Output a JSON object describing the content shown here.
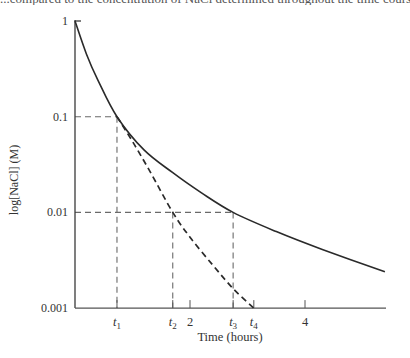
{
  "page": {
    "top_cut_text": "...compared to the concentration of NaCl determined throughout the time course of the dialysis, showing the logarithm of concentration..."
  },
  "chart_data": {
    "type": "line",
    "title": "",
    "xlabel": "Time (hours)",
    "ylabel": "log[NaCl] (M)",
    "yscale": "log",
    "ylim": [
      0.001,
      1
    ],
    "xlim": [
      0,
      5.4
    ],
    "grid": false,
    "legend": null,
    "y_ticks": [
      {
        "value": 1,
        "label": "1"
      },
      {
        "value": 0.1,
        "label": "0.1"
      },
      {
        "value": 0.01,
        "label": "0.01"
      },
      {
        "value": 0.001,
        "label": "0.001"
      }
    ],
    "x_ticks": [
      {
        "value": 0.73,
        "label": "t1",
        "sub": "1",
        "kind": "marker"
      },
      {
        "value": 1.7,
        "label": "t2",
        "sub": "2",
        "kind": "marker"
      },
      {
        "value": 2.0,
        "label": "2",
        "kind": "numeric"
      },
      {
        "value": 2.75,
        "label": "t3",
        "sub": "3",
        "kind": "marker"
      },
      {
        "value": 3.11,
        "label": "t4",
        "sub": "4",
        "kind": "marker"
      },
      {
        "value": 4.0,
        "label": "4",
        "kind": "numeric"
      }
    ],
    "series": [
      {
        "name": "single continuous dialysis",
        "style": "solid",
        "x": [
          0,
          0.2,
          0.4,
          0.73,
          1.2,
          1.7,
          2.2,
          2.75,
          3.5,
          4.3,
          5.39
        ],
        "y": [
          1,
          0.45,
          0.24,
          0.1,
          0.045,
          0.026,
          0.016,
          0.01,
          0.0063,
          0.0041,
          0.0024
        ]
      },
      {
        "name": "dialysis with buffer changes",
        "style": "dashed",
        "x": [
          0.73,
          1.0,
          1.3,
          1.7,
          2.0,
          2.4,
          2.75,
          3.11
        ],
        "y": [
          0.1,
          0.055,
          0.027,
          0.01,
          0.0055,
          0.0028,
          0.0016,
          0.001
        ]
      }
    ],
    "annotations": [
      {
        "type": "dashed-guide",
        "from": [
          0,
          0.1
        ],
        "to": [
          0.73,
          0.1
        ],
        "then_down_to": [
          0.73,
          0.001
        ]
      },
      {
        "type": "dashed-guide",
        "from": [
          0,
          0.01
        ],
        "to": [
          2.75,
          0.01
        ]
      },
      {
        "type": "dashed-guide",
        "vertical_at": 1.7,
        "from_value": 0.01,
        "to_value": 0.001
      },
      {
        "type": "dashed-guide",
        "vertical_at": 2.75,
        "from_value": 0.01,
        "to_value": 0.001
      }
    ]
  }
}
